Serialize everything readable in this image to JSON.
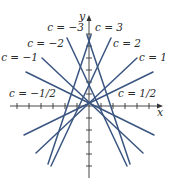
{
  "figure": {
    "axes": {
      "x_label": "x",
      "y_label": "y",
      "origin_px": [
        89,
        106
      ],
      "tick_spacing_px": 12,
      "x_ticks_px": [
        17,
        29,
        41,
        53,
        65,
        77,
        101,
        113,
        125,
        137,
        149
      ],
      "y_ticks_px": [
        34,
        46,
        58,
        70,
        82,
        94,
        118,
        130,
        142,
        154,
        166
      ]
    },
    "line_color": "#3a5580",
    "lines": [
      {
        "c": "-3",
        "label": "c = −3",
        "x1": 87,
        "y1": 35,
        "x2": 130,
        "y2": 164,
        "lx": 84,
        "ly": 31,
        "anchor": "end"
      },
      {
        "c": "3",
        "label": "c = 3",
        "x1": 91,
        "y1": 35,
        "x2": 48,
        "y2": 164,
        "lx": 95,
        "ly": 31,
        "anchor": "start"
      },
      {
        "c": "-2",
        "label": "c = −2",
        "x1": 67,
        "y1": 38,
        "x2": 127,
        "y2": 166,
        "lx": 64,
        "ly": 47,
        "anchor": "end"
      },
      {
        "c": "2",
        "label": "c = 2",
        "x1": 111,
        "y1": 38,
        "x2": 51,
        "y2": 166,
        "lx": 113,
        "ly": 47,
        "anchor": "start"
      },
      {
        "c": "-1",
        "label": "c = −1",
        "x1": 42,
        "y1": 58,
        "x2": 143,
        "y2": 153,
        "lx": 38,
        "ly": 61,
        "anchor": "end"
      },
      {
        "c": "1",
        "label": "c = 1",
        "x1": 137,
        "y1": 58,
        "x2": 36,
        "y2": 153,
        "lx": 139,
        "ly": 61,
        "anchor": "start"
      },
      {
        "c": "-1/2",
        "label": "c = −1/2",
        "x1": 26,
        "y1": 72,
        "x2": 154,
        "y2": 135,
        "lx": 56,
        "ly": 97,
        "anchor": "end"
      },
      {
        "c": "1/2",
        "label": "c = 1/2",
        "x1": 153,
        "y1": 72,
        "x2": 24,
        "y2": 135,
        "lx": 118,
        "ly": 97,
        "anchor": "start"
      }
    ]
  }
}
